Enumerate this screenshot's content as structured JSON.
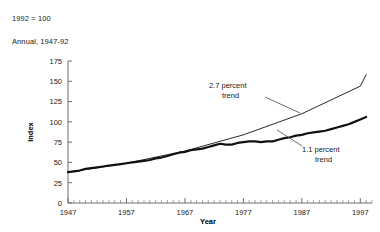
{
  "notes": {
    "base_note": "1992 = 100",
    "frequency_note": "Annual, 1947-92"
  },
  "chart_data": {
    "type": "line",
    "title": "",
    "subtitle": "",
    "xlabel": "Year",
    "ylabel": "Index",
    "xlim": [
      1947,
      1999
    ],
    "ylim": [
      0,
      175
    ],
    "yticks": [
      0,
      25,
      50,
      75,
      100,
      125,
      150,
      175
    ],
    "xticks": [
      1947,
      1957,
      1967,
      1977,
      1987,
      1997
    ],
    "x_minor_tick_interval": 1,
    "grid": false,
    "legend": "none",
    "annotations": [
      {
        "label": "2.7 percent\ntrend",
        "line1": "2.7 percent",
        "line2": "trend"
      },
      {
        "label": "1.1 percent\ntrend",
        "line1": "1.1 percent",
        "line2": "trend"
      }
    ],
    "series": [
      {
        "name": "Index (actual)",
        "style": "thick",
        "x": [
          1947,
          1948,
          1949,
          1950,
          1951,
          1952,
          1953,
          1954,
          1955,
          1956,
          1957,
          1958,
          1959,
          1960,
          1961,
          1962,
          1963,
          1964,
          1965,
          1966,
          1967,
          1968,
          1969,
          1970,
          1971,
          1972,
          1973,
          1974,
          1975,
          1976,
          1977,
          1978,
          1979,
          1980,
          1981,
          1982,
          1983,
          1984,
          1985,
          1986,
          1987,
          1988,
          1989,
          1990,
          1991,
          1992,
          1993,
          1994,
          1995,
          1996,
          1997,
          1998
        ],
        "values": [
          38,
          39,
          40,
          42,
          43,
          44,
          45,
          46,
          47,
          48,
          49,
          50,
          51,
          52,
          53,
          55,
          56,
          58,
          60,
          62,
          63,
          65,
          66,
          67,
          69,
          71,
          73,
          72,
          72,
          74,
          75,
          76,
          76,
          75,
          76,
          76,
          78,
          80,
          81,
          83,
          84,
          86,
          87,
          88,
          89,
          91,
          93,
          95,
          97,
          100,
          103,
          106
        ]
      },
      {
        "name": "2.7 percent trend",
        "style": "thin",
        "x": [
          1947,
          1957,
          1967,
          1977,
          1987,
          1997,
          1998
        ],
        "values": [
          38,
          49,
          64,
          84,
          110,
          144,
          158
        ]
      }
    ]
  }
}
